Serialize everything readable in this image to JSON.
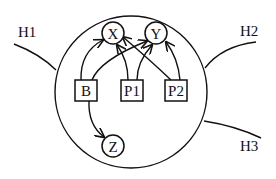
{
  "diagram": {
    "type": "network-diagram",
    "boundary": {
      "label": "",
      "shape": "circle"
    },
    "external_links": [
      {
        "id": "H1",
        "label": "H1"
      },
      {
        "id": "H2",
        "label": "H2"
      },
      {
        "id": "H3",
        "label": "H3"
      }
    ],
    "nodes": {
      "X": {
        "label": "X",
        "shape": "circle"
      },
      "Y": {
        "label": "Y",
        "shape": "circle"
      },
      "Z": {
        "label": "Z",
        "shape": "circle"
      },
      "B": {
        "label": "B",
        "shape": "square"
      },
      "P1": {
        "label": "P1",
        "shape": "square"
      },
      "P2": {
        "label": "P2",
        "shape": "square"
      }
    },
    "edges": [
      {
        "from": "B",
        "to": "X"
      },
      {
        "from": "B",
        "to": "Y"
      },
      {
        "from": "B",
        "to": "Z"
      },
      {
        "from": "P1",
        "to": "X"
      },
      {
        "from": "P1",
        "to": "Y"
      },
      {
        "from": "P2",
        "to": "X"
      },
      {
        "from": "P2",
        "to": "Y"
      }
    ],
    "colors": {
      "ink": "#111111",
      "background": "#ffffff"
    }
  }
}
